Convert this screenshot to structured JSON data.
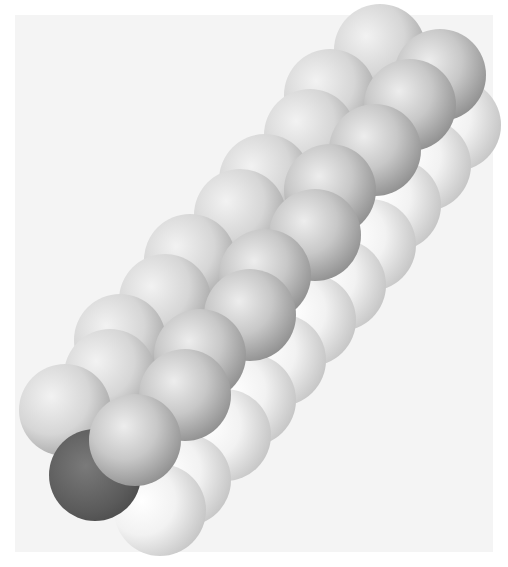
{
  "figure": {
    "style": "grayscale rendered spheres",
    "atom_radius_px": 46,
    "colors": {
      "background": "#f4f4f4",
      "hydrogen_light": "#e6e6e6",
      "hydrogen_shadow": "#8a8a8a",
      "carbon": "#5a5a5a"
    },
    "atoms": {
      "ghost_row": [
        [
          455,
          125
        ],
        [
          425,
          165
        ],
        [
          395,
          205
        ],
        [
          370,
          245
        ],
        [
          340,
          285
        ],
        [
          310,
          320
        ],
        [
          280,
          360
        ],
        [
          250,
          400
        ],
        [
          225,
          435
        ],
        [
          185,
          480
        ],
        [
          160,
          510
        ]
      ],
      "back_row": [
        [
          380,
          50
        ],
        [
          330,
          95
        ],
        [
          310,
          135
        ],
        [
          265,
          180
        ],
        [
          240,
          215
        ],
        [
          190,
          260
        ],
        [
          165,
          300
        ],
        [
          120,
          340
        ],
        [
          110,
          375
        ],
        [
          65,
          410
        ]
      ],
      "carbon": [
        [
          95,
          475
        ]
      ],
      "front_row": [
        [
          440,
          75
        ],
        [
          410,
          105
        ],
        [
          375,
          150
        ],
        [
          330,
          190
        ],
        [
          315,
          235
        ],
        [
          265,
          275
        ],
        [
          250,
          315
        ],
        [
          200,
          355
        ],
        [
          185,
          395
        ],
        [
          135,
          440
        ]
      ]
    }
  }
}
